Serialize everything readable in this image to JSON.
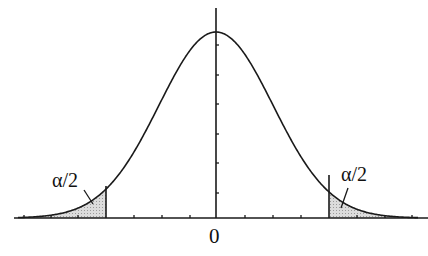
{
  "figure": {
    "labels": {
      "left_tail": "α/2",
      "right_tail": "α/2",
      "center_tick": "0"
    },
    "colors": {
      "line": "#1a1a1a",
      "shade": "#cfcfcf",
      "background": "#ffffff"
    }
  }
}
